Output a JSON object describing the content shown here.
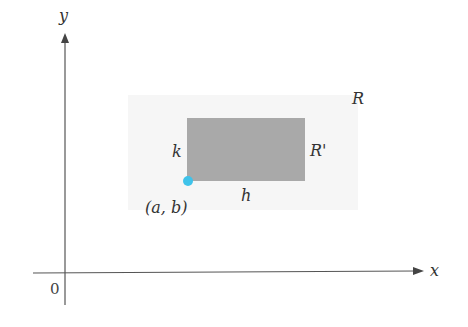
{
  "diagram": {
    "axes": {
      "x_label": "x",
      "y_label": "y",
      "origin_label": "0"
    },
    "region_R": {
      "label": "R"
    },
    "rectangle": {
      "label": "R'",
      "fill": "#a9a9a9",
      "width_label": "h",
      "height_label": "k"
    },
    "corner_point": {
      "label": "(a, b)",
      "color": "#3fc3ea"
    },
    "colors": {
      "axis": "#555555",
      "region_R": "#f7f7f7"
    }
  }
}
